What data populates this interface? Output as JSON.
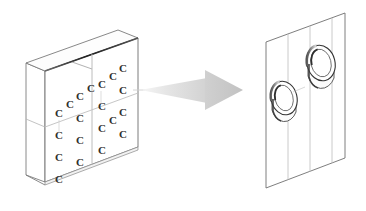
{
  "figure": {
    "background_color": "#ffffff",
    "ink_color": "#3a3a3a",
    "ink_color_light": "#9a9a9a",
    "ink_color_faint": "#c6c6c6",
    "shade_dark": "#2b2b2b"
  },
  "left_object": {
    "name": "perforated-block",
    "description": "Isometric rectangular block with a grid of crescent-shaped dimples on its front face",
    "face_divisions": {
      "columns": 2,
      "rows": 2
    },
    "dimple_glyph": "C",
    "dimple_count": 20,
    "dimple_rows": 5,
    "dimple_columns": 4,
    "front_face": {
      "top_left": [
        45,
        71
      ],
      "top_right": [
        138,
        38
      ],
      "bottom_right": [
        138,
        147
      ],
      "bottom_left": [
        45,
        182
      ]
    },
    "top_face": {
      "front_left": [
        45,
        71
      ],
      "front_right": [
        138,
        38
      ],
      "back_right": [
        118,
        30
      ],
      "back_left": [
        26,
        63
      ]
    },
    "side_face": {
      "front_top": [
        45,
        71
      ],
      "front_bottom": [
        45,
        182
      ],
      "back_bottom": [
        26,
        175
      ],
      "back_top": [
        26,
        63
      ]
    }
  },
  "arrow": {
    "name": "transition-arrow",
    "direction": "right",
    "tail_start_x": 140,
    "tail_end_x": 205,
    "head_tip_x": 243,
    "center_y": 90,
    "color_tail": "#e2e2e2",
    "color_head": "#cbcbcb",
    "meaning": "leads to detail view"
  },
  "right_object": {
    "name": "detail-panel",
    "description": "Tilted flat panel showing two protruding cylindrical rings",
    "grid_lines_vertical": 3,
    "ring_count": 2,
    "panel": {
      "top_left": [
        266,
        42
      ],
      "top_right": [
        345,
        13
      ],
      "bottom_right": [
        345,
        158
      ],
      "bottom_left": [
        266,
        188
      ]
    },
    "rings": [
      {
        "name": "ring-lower-left",
        "center": [
          284,
          104
        ],
        "rx": 13,
        "ry": 17,
        "depth": 12
      },
      {
        "name": "ring-upper-right",
        "center": [
          320,
          70
        ],
        "rx": 14,
        "ry": 18,
        "depth": 13
      }
    ]
  }
}
